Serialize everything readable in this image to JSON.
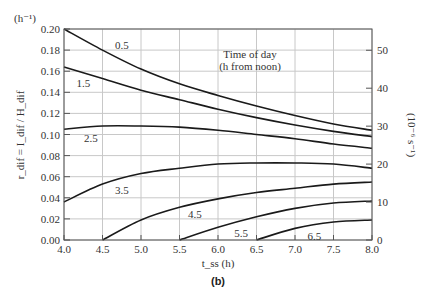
{
  "figure": {
    "panel_label": "(b)",
    "y_unit_left": "(h⁻¹)",
    "ylabel_left": "r_dif = I_dif / H_dif",
    "ylabel_right": "(10⁻⁶ s⁻¹)",
    "xlabel": "t_ss (h)",
    "legend_title_line1": "Time of day",
    "legend_title_line2": "(h from noon)"
  },
  "chart_data": {
    "type": "line",
    "title": "",
    "xlabel": "t_ss (h)",
    "ylabel": "r_dif = I_dif/H_dif (h^-1)",
    "ylabel_right": "(10^-6 s^-1)",
    "xlim": [
      4.0,
      8.0
    ],
    "ylim": [
      0.0,
      0.2
    ],
    "ylim_right": [
      0,
      55.6
    ],
    "x_ticks": [
      "4.0",
      "4.5",
      "5.0",
      "5.5",
      "6.0",
      "6.5",
      "7.0",
      "7.5",
      "8.0"
    ],
    "y_ticks": [
      "0.00",
      "0.02",
      "0.04",
      "0.06",
      "0.08",
      "0.10",
      "0.12",
      "0.14",
      "0.16",
      "0.18",
      "0.20"
    ],
    "y_ticks_right": [
      "0",
      "10",
      "20",
      "30",
      "40",
      "50"
    ],
    "grid": true,
    "legend_position": "inline labels on curves",
    "annotation": "Time of day (h from noon)",
    "series": [
      {
        "name": "0.5",
        "x": [
          4.0,
          4.5,
          5.0,
          5.5,
          6.0,
          6.5,
          7.0,
          7.5,
          8.0
        ],
        "values": [
          0.2,
          0.18,
          0.162,
          0.148,
          0.137,
          0.127,
          0.118,
          0.11,
          0.104
        ]
      },
      {
        "name": "1.5",
        "x": [
          4.0,
          4.5,
          5.0,
          5.5,
          6.0,
          6.5,
          7.0,
          7.5,
          8.0
        ],
        "values": [
          0.164,
          0.153,
          0.142,
          0.133,
          0.124,
          0.116,
          0.109,
          0.103,
          0.098
        ]
      },
      {
        "name": "2.5",
        "x": [
          4.0,
          4.5,
          5.0,
          5.5,
          6.0,
          6.5,
          7.0,
          7.5,
          8.0
        ],
        "values": [
          0.105,
          0.108,
          0.108,
          0.107,
          0.104,
          0.1,
          0.096,
          0.091,
          0.087
        ]
      },
      {
        "name": "3.5",
        "x": [
          4.0,
          4.5,
          5.0,
          5.5,
          6.0,
          6.5,
          7.0,
          7.5,
          8.0
        ],
        "values": [
          0.036,
          0.053,
          0.063,
          0.068,
          0.072,
          0.073,
          0.073,
          0.072,
          0.068
        ]
      },
      {
        "name": "4.5",
        "x": [
          4.5,
          5.0,
          5.5,
          6.0,
          6.5,
          7.0,
          7.5,
          8.0
        ],
        "values": [
          0.0,
          0.019,
          0.031,
          0.039,
          0.045,
          0.049,
          0.053,
          0.055
        ]
      },
      {
        "name": "5.5",
        "x": [
          5.5,
          6.0,
          6.5,
          7.0,
          7.5,
          8.0
        ],
        "values": [
          0.0,
          0.012,
          0.022,
          0.03,
          0.035,
          0.037
        ]
      },
      {
        "name": "6.5",
        "x": [
          6.5,
          7.0,
          7.5,
          8.0
        ],
        "values": [
          0.0,
          0.011,
          0.017,
          0.019
        ]
      }
    ],
    "series_label_positions": [
      {
        "name": "0.5",
        "x": 4.75,
        "y": 0.185
      },
      {
        "name": "1.5",
        "x": 4.25,
        "y": 0.149
      },
      {
        "name": "2.5",
        "x": 4.35,
        "y": 0.097
      },
      {
        "name": "3.5",
        "x": 4.75,
        "y": 0.047
      },
      {
        "name": "4.5",
        "x": 5.7,
        "y": 0.025
      },
      {
        "name": "5.5",
        "x": 6.3,
        "y": 0.007
      },
      {
        "name": "6.5",
        "x": 7.25,
        "y": 0.004
      }
    ]
  }
}
